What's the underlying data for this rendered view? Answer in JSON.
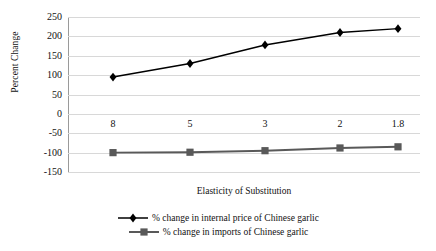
{
  "chart_data": {
    "type": "line",
    "title": "",
    "xlabel": "Elasticity of Substitution",
    "ylabel": "Percent Change",
    "categories": [
      "8",
      "5",
      "3",
      "2",
      "1.8"
    ],
    "ylim": [
      -150,
      250
    ],
    "yticks": [
      250,
      200,
      150,
      100,
      50,
      0,
      -50,
      -100,
      -150
    ],
    "ytick_labels": [
      "250",
      "200",
      "150",
      "100",
      "50",
      "0",
      "-50",
      "-100",
      "-150"
    ],
    "grid": true,
    "legend_position": "bottom",
    "series": [
      {
        "name": "% change in internal price of Chinese garlic",
        "marker": "diamond",
        "color": "#000000",
        "values": [
          95,
          130,
          178,
          210,
          220
        ]
      },
      {
        "name": "% change in imports of Chinese garlic",
        "marker": "square",
        "color": "#595959",
        "values": [
          -100,
          -99,
          -95,
          -88,
          -85
        ]
      }
    ]
  },
  "axes": {
    "y_title": "Percent Change",
    "x_title": "Elasticity of Substitution"
  },
  "legend": {
    "items": [
      {
        "label": "% change in internal price of Chinese garlic",
        "marker": "diamond",
        "color": "#000000"
      },
      {
        "label": "% change in imports of Chinese garlic",
        "marker": "square",
        "color": "#595959"
      }
    ]
  },
  "colors": {
    "series1": "#000000",
    "series2": "#595959",
    "gridline": "#d8d8d8",
    "axis": "#9a9a9a",
    "text": "#111111",
    "background": "#ffffff"
  }
}
